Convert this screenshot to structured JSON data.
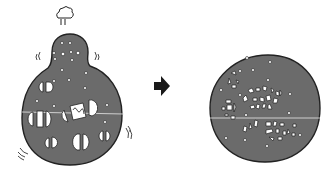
{
  "figure": {
    "colors": {
      "cell_fill": "#6b6b6b",
      "outline": "#222222",
      "organelle_fill": "#ffffff",
      "arrow": "#1a1a1a",
      "background": "#ffffff"
    },
    "panels": [
      {
        "name": "before",
        "label": "swollen-cell"
      },
      {
        "name": "arrow",
        "label": "transition-arrow"
      },
      {
        "name": "after",
        "label": "fragmented-cell"
      }
    ]
  }
}
